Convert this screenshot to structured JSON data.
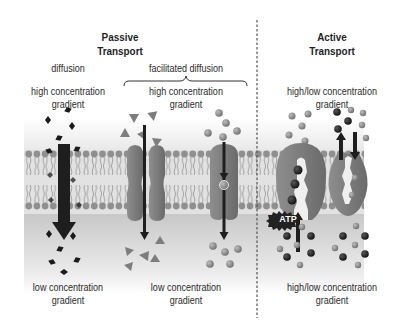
{
  "sections": {
    "passive": {
      "title_line1": "Passive",
      "title_line2": "Transport"
    },
    "active": {
      "title_line1": "Active",
      "title_line2": "Transport"
    }
  },
  "panels": [
    {
      "id": "diffusion",
      "mechanism_label": "diffusion",
      "top_label_line1": "high concentration",
      "top_label_line2": "gradient",
      "bottom_label_line1": "low concentration",
      "bottom_label_line2": "gradient",
      "molecule_shape": "diamond",
      "arrow_direction": "down"
    },
    {
      "id": "facilitated-diffusion",
      "mechanism_label": "facilitated diffusion",
      "top_label_line1": "high concentration",
      "top_label_line2": "gradient",
      "bottom_label_line1": "low concentration",
      "bottom_label_line2": "gradient",
      "subpanels": [
        {
          "id": "channel-protein",
          "molecule_shape": "triangle",
          "arrow_direction": "down"
        },
        {
          "id": "carrier-protein",
          "molecule_shape": "sphere",
          "arrow_direction": "down"
        }
      ]
    },
    {
      "id": "active-transport",
      "top_label_line1": "high/low concentration",
      "top_label_line2": "gradient",
      "bottom_label_line1": "high/low concentration",
      "bottom_label_line2": "gradient",
      "atp_label": "ATP",
      "subpanels": [
        {
          "id": "atp-pump",
          "arrow_direction": "up"
        },
        {
          "id": "cotransport-pump",
          "arrow_direction": "up-and-down"
        }
      ]
    }
  ],
  "colors": {
    "membrane_head": "#8c8c8c",
    "membrane_tail": "#a8a8a8",
    "protein": "#7a7a7a",
    "arrow": "#1e1e1e",
    "molecule_dark": "#1a1a1a",
    "molecule_gray": "#8a8a8a",
    "divider": "#555555"
  }
}
